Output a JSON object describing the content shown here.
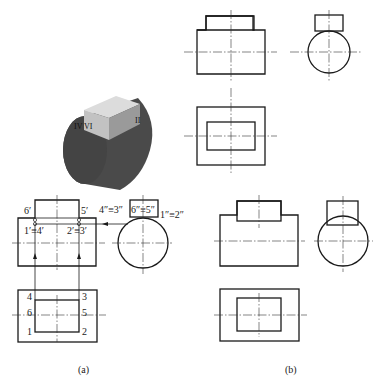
{
  "figure": {
    "captions": {
      "a": "(a)",
      "b": "(b)"
    },
    "isometric": {
      "labels": {
        "left": "IV",
        "left2": "VI",
        "right": "II"
      },
      "colors": {
        "body": "#4a4a4a",
        "top": "#d8d8d8",
        "front": "#bdbdbd",
        "side": "#8a8a8a"
      }
    },
    "view_a": {
      "front_labels": {
        "p6": "6′",
        "p5": "5′",
        "p14": "1′≡4′",
        "p23": "2′≡3′"
      },
      "side_labels": {
        "p43": "4″≡3″",
        "p65": "6″≡5″",
        "p12": "1″≡2″"
      },
      "top_labels": {
        "p4": "4",
        "p3": "3",
        "p6": "6",
        "p5": "5",
        "p1": "1",
        "p2": "2"
      }
    }
  }
}
